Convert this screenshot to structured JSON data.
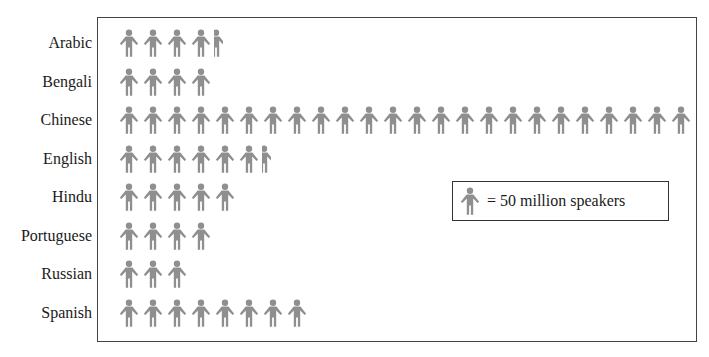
{
  "chart_data": {
    "type": "pictograph",
    "title": "",
    "unit_icon": "person-icon",
    "unit_value": 50,
    "unit_label": "million speakers",
    "legend": {
      "text": "= 50 million speakers",
      "position": "inside-right"
    },
    "categories": [
      "Arabic",
      "Bengali",
      "Chinese",
      "English",
      "Hindu",
      "Portuguese",
      "Russian",
      "Spanish"
    ],
    "icon_counts": [
      4.3,
      4,
      24,
      6.3,
      5,
      4,
      3,
      8
    ],
    "values": [
      215,
      200,
      1200,
      315,
      250,
      200,
      150,
      400
    ],
    "value_unit": "million speakers",
    "icon_color": "#8f8f8f",
    "grid": false
  },
  "rows": [
    {
      "label": "Arabic",
      "full": 4,
      "partial": 0.3
    },
    {
      "label": "Bengali",
      "full": 4,
      "partial": 0
    },
    {
      "label": "Chinese",
      "full": 24,
      "partial": 0
    },
    {
      "label": "English",
      "full": 6,
      "partial": 0.3
    },
    {
      "label": "Hindu",
      "full": 5,
      "partial": 0
    },
    {
      "label": "Portuguese",
      "full": 4,
      "partial": 0
    },
    {
      "label": "Russian",
      "full": 3,
      "partial": 0
    },
    {
      "label": "Spanish",
      "full": 8,
      "partial": 0
    }
  ],
  "legend": {
    "text": "= 50 million speakers"
  }
}
